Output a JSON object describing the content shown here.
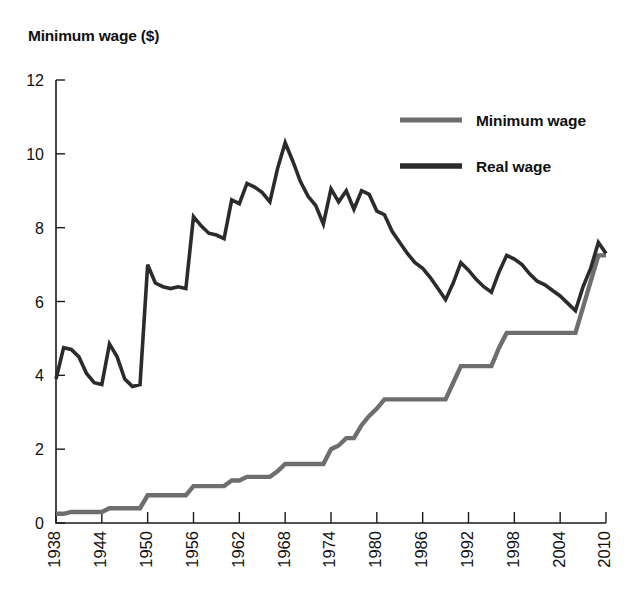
{
  "chart_data": {
    "type": "line",
    "title": "",
    "ylabel": "Minimum wage ($)",
    "xlabel": "",
    "ylim": [
      0,
      12
    ],
    "yticks": [
      0,
      2,
      4,
      6,
      8,
      10,
      12
    ],
    "xlim": [
      1938,
      2010
    ],
    "xticks": [
      1938,
      1944,
      1950,
      1956,
      1962,
      1968,
      1974,
      1980,
      1986,
      1992,
      1998,
      2004,
      2010
    ],
    "xtick_labels": [
      "1938",
      "1944",
      "1950",
      "1956",
      "1962",
      "1968",
      "1974",
      "1980",
      "1986",
      "1992",
      "1998",
      "2004",
      "2010"
    ],
    "ytick_labels": [
      "0",
      "2",
      "4",
      "6",
      "8",
      "10",
      "12"
    ],
    "grid": false,
    "legend_position": "top-right",
    "x": [
      1938,
      1939,
      1940,
      1941,
      1942,
      1943,
      1944,
      1945,
      1946,
      1947,
      1948,
      1949,
      1950,
      1951,
      1952,
      1953,
      1954,
      1955,
      1956,
      1957,
      1958,
      1959,
      1960,
      1961,
      1962,
      1963,
      1964,
      1965,
      1966,
      1967,
      1968,
      1969,
      1970,
      1971,
      1972,
      1973,
      1974,
      1975,
      1976,
      1977,
      1978,
      1979,
      1980,
      1981,
      1982,
      1983,
      1984,
      1985,
      1986,
      1987,
      1988,
      1989,
      1990,
      1991,
      1992,
      1993,
      1994,
      1995,
      1996,
      1997,
      1998,
      1999,
      2000,
      2001,
      2002,
      2003,
      2004,
      2005,
      2006,
      2007,
      2008,
      2009,
      2010
    ],
    "series": [
      {
        "name": "Minimum wage",
        "color": "#6e6e6e",
        "values": [
          0.25,
          0.25,
          0.3,
          0.3,
          0.3,
          0.3,
          0.3,
          0.4,
          0.4,
          0.4,
          0.4,
          0.4,
          0.75,
          0.75,
          0.75,
          0.75,
          0.75,
          0.75,
          1.0,
          1.0,
          1.0,
          1.0,
          1.0,
          1.15,
          1.15,
          1.25,
          1.25,
          1.25,
          1.25,
          1.4,
          1.6,
          1.6,
          1.6,
          1.6,
          1.6,
          1.6,
          2.0,
          2.1,
          2.3,
          2.3,
          2.65,
          2.9,
          3.1,
          3.35,
          3.35,
          3.35,
          3.35,
          3.35,
          3.35,
          3.35,
          3.35,
          3.35,
          3.8,
          4.25,
          4.25,
          4.25,
          4.25,
          4.25,
          4.75,
          5.15,
          5.15,
          5.15,
          5.15,
          5.15,
          5.15,
          5.15,
          5.15,
          5.15,
          5.15,
          5.85,
          6.55,
          7.25,
          7.25
        ]
      },
      {
        "name": "Real wage",
        "color": "#2b2b2b",
        "values": [
          3.9,
          4.75,
          4.7,
          4.5,
          4.05,
          3.8,
          3.75,
          4.85,
          4.5,
          3.9,
          3.7,
          3.75,
          7.0,
          6.5,
          6.4,
          6.35,
          6.4,
          6.35,
          8.3,
          8.05,
          7.85,
          7.8,
          7.7,
          8.75,
          8.65,
          9.2,
          9.1,
          8.95,
          8.7,
          9.6,
          10.3,
          9.8,
          9.25,
          8.85,
          8.6,
          8.1,
          9.05,
          8.7,
          9.0,
          8.5,
          9.0,
          8.9,
          8.45,
          8.35,
          7.9,
          7.6,
          7.3,
          7.05,
          6.9,
          6.65,
          6.35,
          6.05,
          6.5,
          7.05,
          6.85,
          6.6,
          6.4,
          6.25,
          6.8,
          7.25,
          7.15,
          7.0,
          6.75,
          6.55,
          6.45,
          6.3,
          6.15,
          5.95,
          5.75,
          6.4,
          6.9,
          7.6,
          7.3
        ]
      }
    ]
  },
  "legend": {
    "items": [
      {
        "label": "Minimum wage",
        "color": "#6e6e6e"
      },
      {
        "label": "Real wage",
        "color": "#2b2b2b"
      }
    ]
  }
}
